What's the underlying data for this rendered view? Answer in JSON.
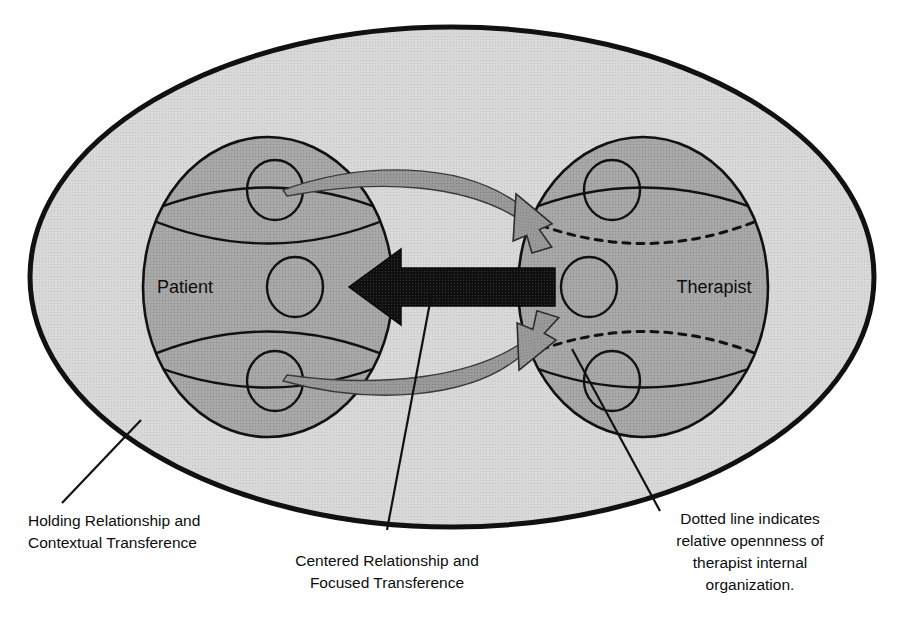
{
  "page": {
    "background_color": "#ffffff",
    "top_partial_text": ""
  },
  "palette": {
    "outer_fill": "#d5d5d5",
    "inner_fill": "#a3a3a3",
    "stroke": "#111111",
    "arrow_black": "#0a0a0a",
    "curved_arrow_fill": "#8e8e8e",
    "curved_arrow_stroke": "#2a2a2a",
    "text": "#0d0d0d"
  },
  "figure": {
    "outer_region": {
      "name": "holding-environment-ellipse",
      "line_style": "solid",
      "fill": "#d5d5d5"
    },
    "actors": [
      {
        "id": "patient",
        "label": "Patient",
        "internal_arc_style": "solid",
        "fill": "#a3a3a3",
        "sub_circles": 3
      },
      {
        "id": "therapist",
        "label": "Therapist",
        "internal_arc_style": "dotted",
        "fill": "#a3a3a3",
        "sub_circles": 3
      }
    ],
    "connectors": [
      {
        "id": "centered-arrow",
        "style": "solid-block",
        "color": "#0a0a0a",
        "direction": "therapist-to-patient",
        "meaning": "Centered Relationship and Focused Transference"
      },
      {
        "id": "upper-curved-arrow",
        "style": "tapered-curve",
        "direction": "patient-to-therapist",
        "color": "#8e8e8e"
      },
      {
        "id": "lower-curved-arrow",
        "style": "tapered-curve",
        "direction": "patient-to-therapist",
        "color": "#8e8e8e"
      }
    ]
  },
  "captions": [
    {
      "id": "holding-caption",
      "align": "left",
      "lines": [
        "Holding Relationship and",
        "Contextual Transference"
      ],
      "leader": "line-to-outer-ellipse"
    },
    {
      "id": "centered-caption",
      "align": "center",
      "lines": [
        "Centered Relationship and",
        "Focused Transference"
      ],
      "leader": "line-to-black-arrow"
    },
    {
      "id": "dotted-caption",
      "align": "center",
      "lines": [
        "Dotted line indicates",
        "relative opennness of",
        "therapist internal",
        "organization."
      ],
      "leader": "line-to-therapist-dotted-arc"
    }
  ]
}
